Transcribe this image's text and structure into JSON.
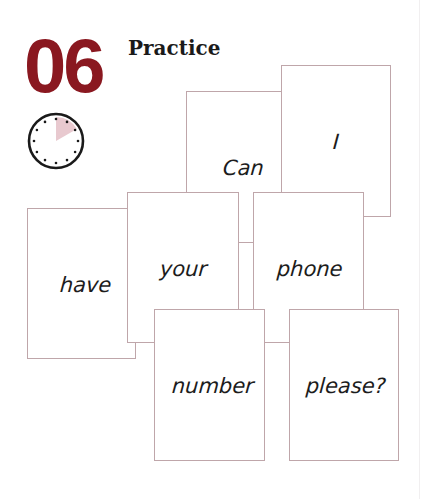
{
  "header": {
    "lesson_number": "06",
    "section_title": "Practice"
  },
  "timer": {
    "icon": "clock-icon",
    "minutes_highlighted": 10,
    "wedge_color": "#e8c9cf",
    "face_color": "#ffffff",
    "rim_color": "#1a1a1a"
  },
  "colors": {
    "accent": "#8a1820",
    "card_border": "#bfa6aa"
  },
  "cards": [
    {
      "word": "Can"
    },
    {
      "word": "I"
    },
    {
      "word": "have"
    },
    {
      "word": "your"
    },
    {
      "word": "phone"
    },
    {
      "word": "number"
    },
    {
      "word": "please?"
    }
  ],
  "sentence": "Can I have your phone number please?"
}
